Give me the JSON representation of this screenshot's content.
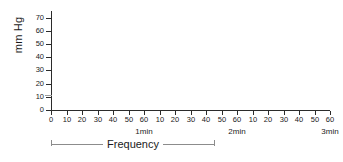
{
  "chart_data": {
    "type": "line",
    "title": "",
    "subtitle": "",
    "xlabel": "",
    "ylabel": "mm Hg",
    "ylim": [
      0,
      75
    ],
    "xlim": [
      0,
      180
    ],
    "grid": false,
    "legend": null,
    "series": [
      {
        "name": "",
        "x": [],
        "y": []
      }
    ],
    "y_ticks": [
      0,
      10,
      20,
      30,
      40,
      50,
      60,
      70
    ],
    "y_tick_labels": [
      "0",
      "10",
      "20",
      "30",
      "40",
      "50",
      "60",
      "70"
    ],
    "x_ticks_seconds": [
      0,
      10,
      20,
      30,
      40,
      50,
      60,
      70,
      80,
      90,
      100,
      110,
      120,
      130,
      140,
      150,
      160,
      170,
      180
    ],
    "x_tick_labels": [
      "0",
      "10",
      "20",
      "30",
      "40",
      "50",
      "60",
      "10",
      "20",
      "30",
      "40",
      "50",
      "60",
      "10",
      "20",
      "30",
      "40",
      "50",
      "60"
    ],
    "minute_marks": [
      {
        "label": "1min",
        "seconds": 60
      },
      {
        "label": "2min",
        "seconds": 120
      },
      {
        "label": "3min",
        "seconds": 180
      }
    ],
    "annotations": [
      {
        "type": "bracket",
        "label": "Frequency",
        "start_seconds": 0,
        "end_seconds": 105
      }
    ]
  },
  "colors": {
    "background": "#ffffff",
    "axis": "#2b2b2b",
    "text": "#1a1a1a",
    "bracket": "#8c8c8c"
  }
}
